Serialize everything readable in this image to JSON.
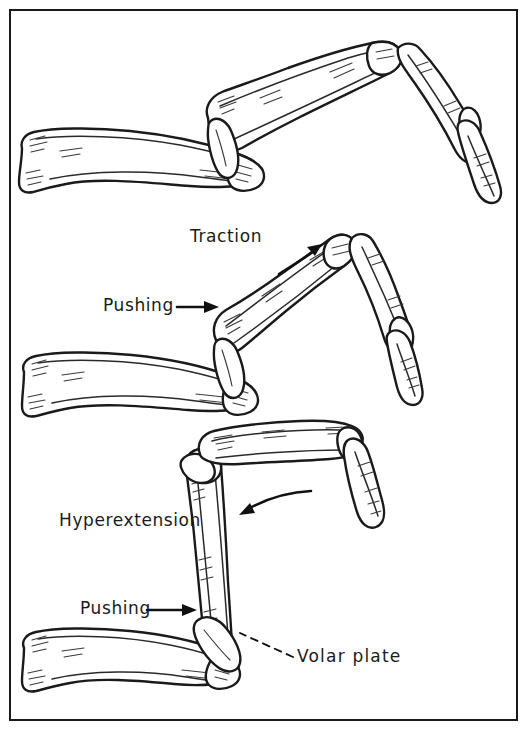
{
  "figure": {
    "border_color": "#1a1a1a",
    "ink_color": "#1a1a1a",
    "background_color": "#ffffff",
    "panel_count": 3
  },
  "labels": {
    "traction": "Traction",
    "pushing_middle": "Pushing",
    "hyperextension": "Hyperextension",
    "pushing_bottom": "Pushing",
    "volar_plate": "Volar  plate"
  },
  "panels": [
    {
      "id": "panel-top",
      "name": "dorsal-dislocation-illustration",
      "caption": "",
      "labels": []
    },
    {
      "id": "panel-middle",
      "name": "traction-and-pushing-illustration",
      "caption": "",
      "labels": [
        "Traction",
        "Pushing"
      ]
    },
    {
      "id": "panel-bottom",
      "name": "hyperextension-reduction-illustration",
      "caption": "",
      "labels": [
        "Hyperextension",
        "Pushing",
        "Volar  plate"
      ]
    }
  ],
  "arrows": [
    {
      "name": "traction-arrow",
      "direction": "up-right",
      "style": "solid"
    },
    {
      "name": "pushing-arrow-middle",
      "direction": "right",
      "style": "solid"
    },
    {
      "name": "hyperextension-arrow",
      "direction": "left-curved",
      "style": "solid"
    },
    {
      "name": "pushing-arrow-bottom",
      "direction": "right",
      "style": "solid"
    },
    {
      "name": "volar-plate-leader",
      "direction": "up-left",
      "style": "dashed"
    }
  ]
}
